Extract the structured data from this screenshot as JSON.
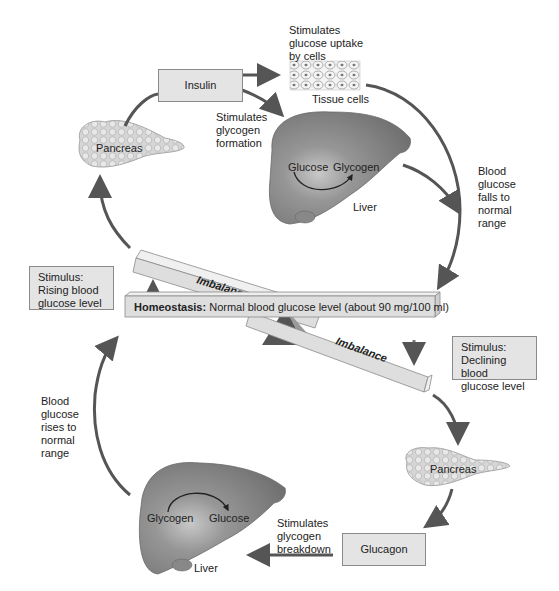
{
  "diagram": {
    "colors": {
      "arrow": "#555555",
      "box_fill": "#e4e4e4",
      "box_border": "#8a8a8a",
      "liver": "#8c8c8c",
      "pancreas": "#d4d4d4",
      "beam": "#dedede",
      "fulcrum": "#555555"
    },
    "top_loop": {
      "hormone_box": "Insulin",
      "pancreas_label": "Pancreas",
      "tissue_effect": "Stimulates\nglucose uptake\nby cells",
      "tissue_label": "Tissue cells",
      "liver_effect": "Stimulates\nglycogen\nformation",
      "liver_conversion_from": "Glucose",
      "liver_conversion_to": "Glycogen",
      "liver_label": "Liver",
      "result": "Blood\nglucose\nfalls to\nnormal\nrange",
      "stimulus": "Stimulus:\nRising blood\nglucose level"
    },
    "balance": {
      "homeostasis_bold": "Homeostasis:",
      "homeostasis_text": " Normal blood glucose level (about 90 mg/100 ml)",
      "imbalance_top": "Imbalance",
      "imbalance_bottom": "Imbalance"
    },
    "bottom_loop": {
      "stimulus": "Stimulus:\nDeclining blood\nglucose level",
      "pancreas_label": "Pancreas",
      "hormone_box": "Glucagon",
      "liver_effect": "Stimulates\nglycogen\nbreakdown",
      "liver_conversion_from": "Glycogen",
      "liver_conversion_to": "Glucose",
      "liver_label": "Liver",
      "result": "Blood\nglucose\nrises to\nnormal\nrange"
    }
  }
}
